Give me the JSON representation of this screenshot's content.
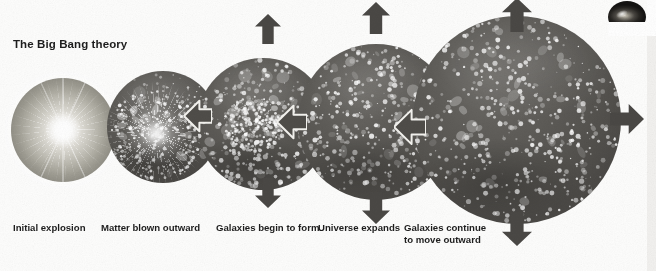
{
  "diagram": {
    "title": "The Big Bang theory",
    "background_color": "#fdfdfc",
    "sphere_dark_color": "#5a5854",
    "sphere_light_color": "#b0aea4",
    "arrow_color": "#4a4845",
    "text_color": "#1d1d1d"
  },
  "stages": [
    {
      "id": "initial-explosion",
      "caption": "Initial explosion",
      "caption_x": 13,
      "caption_y": 222,
      "cx": 63,
      "cy": 130,
      "r": 52,
      "kind": "halo"
    },
    {
      "id": "matter-blown-outward",
      "caption": "Matter blown outward",
      "caption_x": 101,
      "caption_y": 222,
      "cx": 163,
      "cy": 127,
      "r": 56,
      "kind": "burst"
    },
    {
      "id": "galaxies-begin-to-form",
      "caption": "Galaxies begin to form",
      "caption_x": 216,
      "caption_y": 222,
      "cx": 263,
      "cy": 124,
      "r": 66,
      "kind": "cluster"
    },
    {
      "id": "universe-expands",
      "caption": "Universe expands",
      "caption_x": 318,
      "caption_y": 222,
      "cx": 376,
      "cy": 122,
      "r": 78,
      "kind": "field"
    },
    {
      "id": "galaxies-continue-to-move-outward",
      "caption": "Galaxies continue\nto move outward",
      "caption_x": 404,
      "caption_y": 222,
      "cx": 517,
      "cy": 120,
      "r": 104,
      "kind": "field"
    }
  ],
  "arrows": {
    "expansion_label": "expansion-arrow",
    "link_label": "stage-transition-arrow",
    "items": [
      {
        "name": "expansion-arrow-up-stage3",
        "dir": "up",
        "x": 255,
        "y": 14,
        "w": 26,
        "h": 30
      },
      {
        "name": "expansion-arrow-down-stage3",
        "dir": "down",
        "x": 255,
        "y": 178,
        "w": 26,
        "h": 30
      },
      {
        "name": "expansion-arrow-up-stage4",
        "dir": "up",
        "x": 362,
        "y": 2,
        "w": 28,
        "h": 32
      },
      {
        "name": "expansion-arrow-down-stage4",
        "dir": "down",
        "x": 362,
        "y": 192,
        "w": 28,
        "h": 32
      },
      {
        "name": "expansion-arrow-up-stage5",
        "dir": "up",
        "x": 502,
        "y": -2,
        "w": 30,
        "h": 34
      },
      {
        "name": "expansion-arrow-down-stage5",
        "dir": "down",
        "x": 502,
        "y": 212,
        "w": 30,
        "h": 34
      },
      {
        "name": "expansion-arrow-right-stage5",
        "dir": "right",
        "x": 610,
        "y": 104,
        "w": 34,
        "h": 30
      }
    ],
    "links": [
      {
        "name": "stage-transition-arrow-2-to-1",
        "x": 184,
        "y": 99,
        "w": 28,
        "h": 34
      },
      {
        "name": "stage-transition-arrow-3-to-2",
        "x": 277,
        "y": 104,
        "w": 30,
        "h": 36
      },
      {
        "name": "stage-transition-arrow-4-to-3",
        "x": 394,
        "y": 108,
        "w": 32,
        "h": 38
      }
    ]
  },
  "inset": {
    "name": "galaxy-photo",
    "alt": "galaxy"
  }
}
